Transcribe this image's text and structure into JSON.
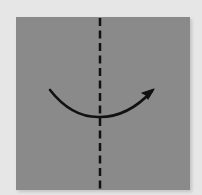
{
  "diagram": {
    "type": "origami-fold-step",
    "paper": {
      "shape": "square",
      "color": "#8a8a8a"
    },
    "background_color": "#e6e6e6",
    "fold_line": {
      "style": "dashed",
      "orientation": "vertical",
      "position": "center",
      "meaning": "valley-fold"
    },
    "arrow": {
      "direction": "left-to-right",
      "shape": "curved",
      "color": "#111111"
    }
  }
}
